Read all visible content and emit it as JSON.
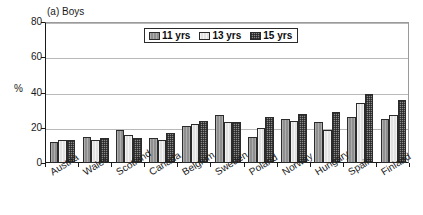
{
  "panel": {
    "label": "(a) Boys"
  },
  "axes": {
    "y_title": "%",
    "y_ticks": [
      "0",
      "20",
      "40",
      "60",
      "80"
    ]
  },
  "legend": {
    "items": [
      {
        "label": "11 yrs",
        "swatch": "mid-gray-vertical-hatch"
      },
      {
        "label": "13 yrs",
        "swatch": "light-gray"
      },
      {
        "label": "15 yrs",
        "swatch": "dark-gray-checker"
      }
    ]
  },
  "chart_data": {
    "type": "bar",
    "title": "(a) Boys",
    "xlabel": "",
    "ylabel": "%",
    "ylim": [
      0,
      80
    ],
    "yticks": [
      0,
      20,
      40,
      60,
      80
    ],
    "grid": true,
    "legend_position": "top-center-inside",
    "categories": [
      "Austria",
      "Wales",
      "Scotland",
      "Canada",
      "Belgium",
      "Sweden",
      "Poland",
      "Norway",
      "Hungary",
      "Spain",
      "Finland"
    ],
    "series": [
      {
        "name": "11 yrs",
        "values": [
          12,
          15,
          19,
          14,
          21,
          27,
          15,
          25,
          23,
          26,
          25
        ]
      },
      {
        "name": "13 yrs",
        "values": [
          13,
          13,
          16,
          13,
          22,
          23,
          20,
          24,
          19,
          34,
          27
        ]
      },
      {
        "name": "15 yrs",
        "values": [
          13,
          14,
          14,
          17,
          24,
          23,
          26,
          28,
          29,
          39,
          36
        ]
      }
    ]
  },
  "colors": {
    "series_11yrs": "#8f8f8f",
    "series_13yrs": "#e2e2e2",
    "series_15yrs": "#8a8a8a",
    "axis": "#1a1a1a",
    "gridline": "#b9b9b9",
    "background": "#ffffff"
  }
}
